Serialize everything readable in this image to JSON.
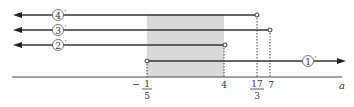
{
  "diagram": {
    "axis_label": "a",
    "ticks": [
      {
        "id": "neg-one-fifth",
        "sign": "−",
        "num": "1",
        "den": "5",
        "x": 147
      },
      {
        "id": "four",
        "text": "4",
        "x": 224
      },
      {
        "id": "seventeen-thirds",
        "num": "17",
        "den": "3",
        "x": 257
      },
      {
        "id": "seven",
        "text": "7",
        "x": 270
      }
    ],
    "rays": [
      {
        "id": "4",
        "label": "4",
        "prime": "′",
        "direction": "left",
        "end_x": 257,
        "y": 15,
        "endpoint": "open"
      },
      {
        "id": "3",
        "label": "3",
        "prime": "′",
        "direction": "left",
        "end_x": 270,
        "y": 30,
        "endpoint": "open"
      },
      {
        "id": "2",
        "label": "2",
        "prime": "′",
        "direction": "left",
        "end_x": 225,
        "y": 45,
        "endpoint": "open"
      },
      {
        "id": "1",
        "label": "1",
        "prime": "′",
        "direction": "right",
        "start_x": 147,
        "y": 61,
        "endpoint": "open"
      }
    ],
    "shaded_region": {
      "from": "-1/5",
      "to": "4",
      "color": "#d9d9d9"
    },
    "colors": {
      "line": "#333333",
      "shade": "#d9d9d9",
      "dotted": "#444444"
    }
  }
}
